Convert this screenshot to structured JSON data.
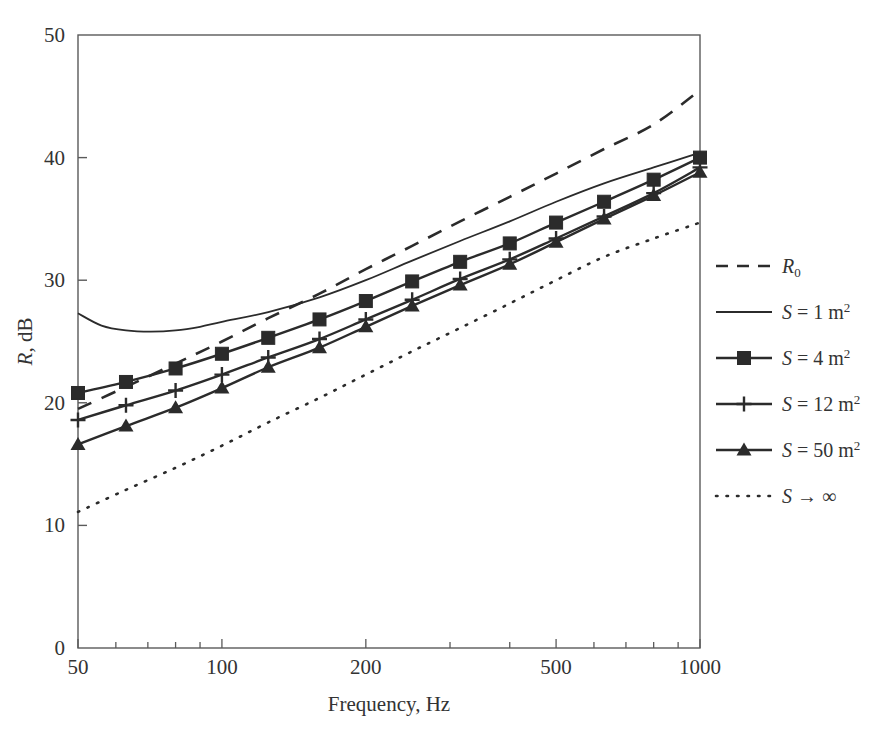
{
  "chart_data": {
    "type": "line",
    "title": "",
    "xlabel": "Frequency, Hz",
    "ylabel": "R, dB",
    "xscale": "log",
    "xlim": [
      50,
      1000
    ],
    "ylim": [
      0,
      50
    ],
    "yticks": [
      0,
      10,
      20,
      30,
      40,
      50
    ],
    "xticks": [
      50,
      100,
      200,
      500,
      1000
    ],
    "xticklabels": [
      "50",
      "100",
      "200",
      "500",
      "1000"
    ],
    "yticklabels": [
      "0",
      "10",
      "20",
      "30",
      "40",
      "50"
    ],
    "grid": false,
    "legend_position": "right",
    "series": [
      {
        "name": "R0",
        "label": "R",
        "label_sub": "0",
        "style": "dashed",
        "marker": "none",
        "color": "#2b2b2b",
        "x": [
          50,
          63,
          80,
          100,
          125,
          160,
          200,
          250,
          315,
          400,
          500,
          630,
          800,
          1000
        ],
        "y": [
          19.5,
          21.3,
          23.2,
          25.0,
          26.9,
          28.9,
          30.9,
          32.8,
          34.8,
          36.8,
          38.7,
          40.7,
          42.7,
          45.5
        ]
      },
      {
        "name": "S-1",
        "label": "S = 1 m",
        "label_sup": "2",
        "style": "solid-thin",
        "marker": "none",
        "color": "#2b2b2b",
        "x": [
          50,
          56,
          63,
          71,
          80,
          90,
          100,
          125,
          160,
          200,
          250,
          315,
          400,
          500,
          630,
          800,
          1000
        ],
        "y": [
          27.3,
          26.3,
          25.9,
          25.8,
          25.9,
          26.2,
          26.6,
          27.4,
          28.6,
          30.0,
          31.6,
          33.2,
          34.8,
          36.4,
          37.9,
          39.2,
          40.4
        ]
      },
      {
        "name": "S-4",
        "label": "S = 4 m",
        "label_sup": "2",
        "style": "solid",
        "marker": "square",
        "color": "#2b2b2b",
        "x": [
          50,
          63,
          80,
          100,
          125,
          160,
          200,
          250,
          315,
          400,
          500,
          630,
          800,
          1000
        ],
        "y": [
          20.8,
          21.7,
          22.8,
          24.0,
          25.3,
          26.8,
          28.3,
          29.9,
          31.5,
          33.0,
          34.7,
          36.4,
          38.2,
          40.0
        ]
      },
      {
        "name": "S-12",
        "label": "S = 12 m",
        "label_sup": "2",
        "style": "solid",
        "marker": "plus",
        "color": "#2b2b2b",
        "x": [
          50,
          63,
          80,
          100,
          125,
          160,
          200,
          250,
          315,
          400,
          500,
          630,
          800,
          1000
        ],
        "y": [
          18.6,
          19.8,
          21.0,
          22.3,
          23.7,
          25.2,
          26.8,
          28.4,
          30.1,
          31.7,
          33.4,
          35.2,
          37.1,
          39.2
        ]
      },
      {
        "name": "S-50",
        "label": "S = 50 m",
        "label_sup": "2",
        "style": "solid",
        "marker": "triangle",
        "color": "#2b2b2b",
        "x": [
          50,
          63,
          80,
          100,
          125,
          160,
          200,
          250,
          315,
          400,
          500,
          630,
          800,
          1000
        ],
        "y": [
          16.6,
          18.1,
          19.6,
          21.2,
          22.9,
          24.5,
          26.2,
          27.9,
          29.6,
          31.3,
          33.1,
          35.0,
          36.9,
          38.8
        ]
      },
      {
        "name": "S-inf",
        "label": "S → ∞",
        "style": "dotted",
        "marker": "none",
        "color": "#2b2b2b",
        "x": [
          50,
          63,
          80,
          100,
          125,
          160,
          200,
          250,
          315,
          400,
          500,
          630,
          800,
          1000
        ],
        "y": [
          11.1,
          12.9,
          14.7,
          16.5,
          18.4,
          20.4,
          22.3,
          24.2,
          26.1,
          28.1,
          30.0,
          31.9,
          33.4,
          34.7
        ]
      }
    ]
  },
  "axes": {
    "ylabel_italic": "R",
    "ylabel_rest": ", dB",
    "xlabel": "Frequency, Hz"
  },
  "legend": {
    "items": [
      {
        "label": "R",
        "sub": "0",
        "sup": "",
        "italic": true,
        "style": "dashed",
        "marker": "none"
      },
      {
        "label": "S",
        "eq": " = 1 m",
        "sup": "2",
        "italic": true,
        "style": "solid-thin",
        "marker": "none"
      },
      {
        "label": "S",
        "eq": " = 4 m",
        "sup": "2",
        "italic": true,
        "style": "solid",
        "marker": "square"
      },
      {
        "label": "S",
        "eq": " = 12 m",
        "sup": "2",
        "italic": true,
        "style": "solid",
        "marker": "plus"
      },
      {
        "label": "S",
        "eq": " = 50 m",
        "sup": "2",
        "italic": true,
        "style": "solid",
        "marker": "triangle"
      },
      {
        "label": "S",
        "eq": " → ∞",
        "sup": "",
        "italic": true,
        "style": "dotted",
        "marker": "none"
      }
    ]
  },
  "colors": {
    "ink": "#2b2b2b",
    "axis": "#555555",
    "background": "#ffffff"
  }
}
